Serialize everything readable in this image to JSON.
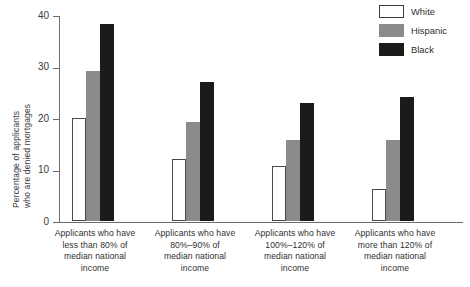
{
  "chart_data": {
    "type": "bar",
    "title": "",
    "xlabel": "",
    "ylabel_line1": "Percentage of applicants",
    "ylabel_line2": "who are denied mortgages",
    "ylim": [
      0,
      40
    ],
    "yticks": [
      0,
      10,
      20,
      30,
      40
    ],
    "ytick_labels": [
      "0",
      "10",
      "20",
      "30",
      "40"
    ],
    "grid": false,
    "legend_position": "top-right",
    "categories": [
      "Applicants who have less than 80% of median national income",
      "Applicants who have 80%–90% of median national income",
      "Applicants who have 100%–120% of median national income",
      "Applicants who have more than 120% of median national income"
    ],
    "category_lines": [
      [
        "Applicants who have",
        "less than 80% of",
        "median national",
        "income"
      ],
      [
        "Applicants who have",
        "80%–90% of",
        "median national",
        "income"
      ],
      [
        "Applicants who have",
        "100%–120% of",
        "median national",
        "income"
      ],
      [
        "Applicants who have",
        "more than 120% of",
        "median national",
        "income"
      ]
    ],
    "series": [
      {
        "name": "White",
        "color": "#ffffff",
        "values": [
          20.0,
          12.0,
          10.7,
          6.3
        ]
      },
      {
        "name": "Hispanic",
        "color": "#8b8b8b",
        "values": [
          29.2,
          19.3,
          15.7,
          15.8
        ]
      },
      {
        "name": "Black",
        "color": "#1b1b1b",
        "values": [
          38.2,
          27.0,
          23.0,
          24.0
        ]
      }
    ]
  },
  "legend": {
    "items": [
      {
        "label": "White"
      },
      {
        "label": "Hispanic"
      },
      {
        "label": "Black"
      }
    ]
  }
}
